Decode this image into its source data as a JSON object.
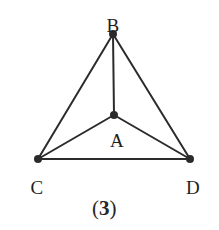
{
  "figure": {
    "caption_open": "(",
    "caption_number": "3",
    "caption_close": ")",
    "background_color": "#ffffff",
    "stroke_color": "#2b2b2b",
    "label_color": "#1f1f1f"
  },
  "chart_data": {
    "type": "diagram",
    "title": "(3)",
    "nodes": [
      {
        "id": "B",
        "label": "B",
        "x": 113,
        "y": 34,
        "label_x": 113,
        "label_y": 16
      },
      {
        "id": "A",
        "label": "A",
        "x": 114,
        "y": 115,
        "label_x": 117,
        "label_y": 131
      },
      {
        "id": "C",
        "label": "C",
        "x": 38,
        "y": 159,
        "label_x": 37,
        "label_y": 178
      },
      {
        "id": "D",
        "label": "D",
        "x": 190,
        "y": 159,
        "label_x": 193,
        "label_y": 178
      }
    ],
    "edges": [
      {
        "from": "B",
        "to": "C"
      },
      {
        "from": "B",
        "to": "D"
      },
      {
        "from": "B",
        "to": "A"
      },
      {
        "from": "A",
        "to": "C"
      },
      {
        "from": "A",
        "to": "D"
      },
      {
        "from": "C",
        "to": "D"
      }
    ],
    "node_count": 4,
    "edge_count": 6,
    "xlim": [
      0,
      219
    ],
    "ylim": [
      0,
      230
    ],
    "grid": false,
    "legend": false
  }
}
